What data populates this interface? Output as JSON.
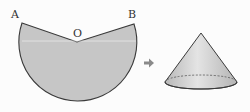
{
  "diagram": {
    "labels": {
      "point_a": "A",
      "point_b": "B",
      "center_o": "O"
    },
    "sector": {
      "center": [
        77,
        42
      ],
      "radius": 59,
      "point_a": [
        22,
        23
      ],
      "point_b": [
        134,
        24
      ],
      "fill": "#c8c8c8",
      "stroke": "#444444"
    },
    "arrow": {
      "icon": "right-arrow-icon",
      "color": "#888888"
    },
    "cone": {
      "apex": [
        201,
        33
      ],
      "base_center": [
        201,
        82
      ],
      "base_rx": 36,
      "base_ry": 7,
      "fill": "#cdcdcd",
      "stroke": "#444444"
    }
  }
}
